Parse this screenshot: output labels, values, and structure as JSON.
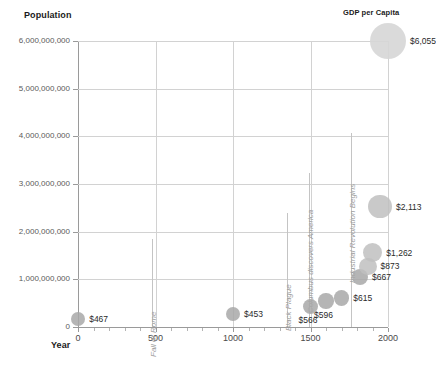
{
  "chart_data": {
    "type": "scatter",
    "title": "",
    "xlabel": "Year",
    "ylabel": "Population",
    "bubble_legend_label": "GDP per Capita",
    "xlim": [
      0,
      2000
    ],
    "ylim": [
      0,
      6000000000
    ],
    "grid": true,
    "legend_position": "top-right",
    "x_ticks": [
      "0",
      "500",
      "1000",
      "1500",
      "2000"
    ],
    "x_tick_values": [
      0,
      500,
      1000,
      1500,
      2000
    ],
    "y_ticks": [
      "0",
      "1,000,000,000",
      "2,000,000,000",
      "3,000,000,000",
      "4,000,000,000",
      "5,000,000,000",
      "6,000,000,000"
    ],
    "y_tick_values": [
      0,
      1000000000,
      2000000000,
      3000000000,
      4000000000,
      5000000000,
      6000000000
    ],
    "series": [
      {
        "name": "World population vs GDP per capita",
        "points": [
          {
            "year": 0,
            "population": 170000000,
            "gdp_per_capita": 467,
            "label": "$467"
          },
          {
            "year": 1000,
            "population": 265000000,
            "gdp_per_capita": 453,
            "label": "$453"
          },
          {
            "year": 1500,
            "population": 425000000,
            "gdp_per_capita": 566,
            "label": "$566"
          },
          {
            "year": 1600,
            "population": 545000000,
            "gdp_per_capita": 596,
            "label": "$596"
          },
          {
            "year": 1700,
            "population": 610000000,
            "gdp_per_capita": 615,
            "label": "$615"
          },
          {
            "year": 1820,
            "population": 1040000000,
            "gdp_per_capita": 667,
            "label": "$667"
          },
          {
            "year": 1870,
            "population": 1270000000,
            "gdp_per_capita": 873,
            "label": "$873"
          },
          {
            "year": 1900,
            "population": 1560000000,
            "gdp_per_capita": 1262,
            "label": "$1,262"
          },
          {
            "year": 1950,
            "population": 2525000000,
            "gdp_per_capita": 2113,
            "label": "$2,113"
          },
          {
            "year": 2000,
            "population": 6000000000,
            "gdp_per_capita": 6055,
            "label": "$6,055"
          }
        ]
      }
    ],
    "annotations": [
      {
        "text": "Fall of Rome",
        "year": 476
      },
      {
        "text": "Black Plague",
        "year": 1350
      },
      {
        "text": "Columbus discovers America",
        "year": 1492
      },
      {
        "text": "Industrial Revolution Begins",
        "year": 1760
      }
    ]
  }
}
